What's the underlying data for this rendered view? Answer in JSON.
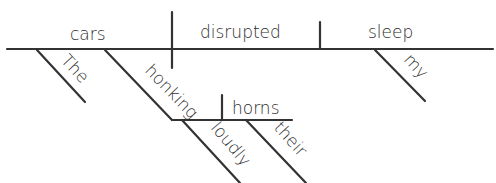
{
  "diagram": {
    "type": "Reed-Kellogg sentence diagram",
    "sentence_words": [
      "The",
      "honking",
      "horns",
      "loudly",
      "their",
      "cars",
      "disrupted",
      "my",
      "sleep"
    ],
    "baseline": {
      "subject": "cars",
      "verb": "disrupted",
      "object": "sleep"
    },
    "modifiers": {
      "the": "The",
      "participle": "honking",
      "participle_object": "horns",
      "adverb": "loudly",
      "possessive_their": "their",
      "possessive_my": "my"
    },
    "line_color": "#333333",
    "text_color": "#2b2b2b"
  }
}
